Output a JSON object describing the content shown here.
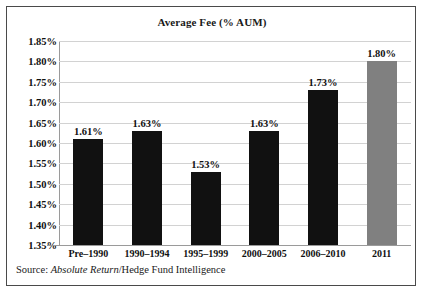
{
  "figure": {
    "title": "Average Fee (% AUM)",
    "source_prefix": "Source: ",
    "source_italic": "Absolute Return",
    "source_rest": "/Hedge Fund Intelligence"
  },
  "colors": {
    "bar_default": "#111111",
    "bar_highlight": "#808080",
    "gridline": "#d2d2d2",
    "axis": "#9a9a9a",
    "frame": "#4a4a4a",
    "text": "#111111",
    "background": "#ffffff"
  },
  "chart_data": {
    "type": "bar",
    "title": "Average Fee (% AUM)",
    "xlabel": "",
    "ylabel": "",
    "ylim": [
      1.35,
      1.85
    ],
    "ytick_step": 0.05,
    "ytick_labels": [
      "1.85%",
      "1.80%",
      "1.75%",
      "1.70%",
      "1.65%",
      "1.60%",
      "1.55%",
      "1.50%",
      "1.45%",
      "1.40%",
      "1.35%"
    ],
    "ytick_values": [
      1.85,
      1.8,
      1.75,
      1.7,
      1.65,
      1.6,
      1.55,
      1.5,
      1.45,
      1.4,
      1.35
    ],
    "grid": true,
    "legend": "none",
    "categories": [
      "Pre–1990",
      "1990–1994",
      "1995–1999",
      "2000–2005",
      "2006–2010",
      "2011"
    ],
    "values": [
      1.61,
      1.63,
      1.53,
      1.63,
      1.73,
      1.8
    ],
    "data_labels": [
      "1.61%",
      "1.63%",
      "1.53%",
      "1.63%",
      "1.73%",
      "1.80%"
    ],
    "bar_colors": [
      "#111111",
      "#111111",
      "#111111",
      "#111111",
      "#111111",
      "#808080"
    ],
    "units": "% AUM",
    "source": "Source: Absolute Return/Hedge Fund Intelligence"
  }
}
